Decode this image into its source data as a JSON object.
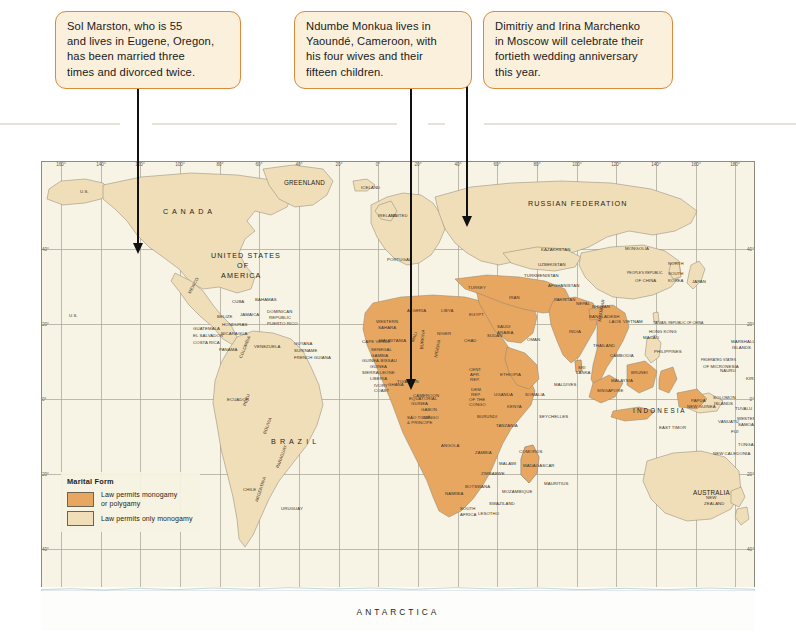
{
  "callouts": [
    {
      "id": "callout-sol-marston",
      "lines": [
        "Sol Marston, who is 55",
        "and lives in Eugene, Oregon,",
        "has been married three",
        "times and divorced twice."
      ]
    },
    {
      "id": "callout-ndumbe-monkua",
      "lines": [
        "Ndumbe Monkua lives in",
        "Yaoundé, Cameroon, with",
        "his four wives and their",
        "fifteen children."
      ]
    },
    {
      "id": "callout-marchenko",
      "lines": [
        "Dimitriy and Irina Marchenko",
        "in Moscow will celebrate their",
        "fortieth wedding anniversary",
        "this year."
      ]
    }
  ],
  "legend": {
    "title": "Marital Form",
    "items": [
      {
        "label_line1": "Law permits monogamy",
        "label_line2": "or polygamy",
        "color": "#e8a761"
      },
      {
        "label_line1": "Law permits only monogamy",
        "label_line2": "",
        "color": "#f0deb8"
      }
    ]
  },
  "map": {
    "antarctica_label": "ANTARCTICA",
    "longitudes": [
      "160°",
      "140°",
      "120°",
      "100°",
      "80°",
      "60°",
      "40°",
      "20°",
      "0°",
      "20°",
      "40°",
      "60°",
      "80°",
      "100°",
      "120°",
      "140°",
      "160°",
      "180°"
    ],
    "latitudes": [
      "40°",
      "20°",
      "0°",
      "20°",
      "40°"
    ],
    "colors": {
      "polygamy": "#e8a761",
      "monogamy": "#f0deb8",
      "ocean": "#f7f4e6",
      "border": "#8d8d7d",
      "graticule": "#a9a797"
    },
    "continent_labels": [
      {
        "text": "C A N A D A",
        "x": 122,
        "y": 46,
        "size": "mid"
      },
      {
        "text": "UNITED STATES",
        "x": 170,
        "y": 90,
        "size": "mid"
      },
      {
        "text": "OF",
        "x": 196,
        "y": 100,
        "size": "mid"
      },
      {
        "text": "AMERICA",
        "x": 180,
        "y": 110,
        "size": "mid"
      },
      {
        "text": "GREENLAND",
        "x": 243,
        "y": 18,
        "size": "norm"
      },
      {
        "text": "RUSSIAN   FEDERATION",
        "x": 487,
        "y": 38,
        "size": "mid"
      },
      {
        "text": "B R A Z I L",
        "x": 230,
        "y": 276,
        "size": "mid"
      },
      {
        "text": "A N T A R C T I C A",
        "x": 0,
        "y": 0,
        "size": "big"
      },
      {
        "text": "I N D O N E S I A",
        "x": 592,
        "y": 246,
        "size": "norm"
      },
      {
        "text": "AUSTRALIA",
        "x": 652,
        "y": 328,
        "size": "norm"
      }
    ],
    "country_labels": [
      {
        "t": "U.S.",
        "x": 39,
        "y": 28
      },
      {
        "t": "U.S.",
        "x": 28,
        "y": 152
      },
      {
        "t": "MEXICO",
        "x": 146,
        "y": 131,
        "r": -62
      },
      {
        "t": "CUBA",
        "x": 191,
        "y": 138
      },
      {
        "t": "BAHAMAS",
        "x": 214,
        "y": 136
      },
      {
        "t": "DOMINICAN",
        "x": 226,
        "y": 148
      },
      {
        "t": "REPUBLIC",
        "x": 228,
        "y": 154
      },
      {
        "t": "PUERTO RICO",
        "x": 226,
        "y": 160
      },
      {
        "t": "BELIZE",
        "x": 176,
        "y": 153
      },
      {
        "t": "JAMAICA",
        "x": 199,
        "y": 151
      },
      {
        "t": "GUATEMALA",
        "x": 152,
        "y": 165
      },
      {
        "t": "HONDURAS",
        "x": 181,
        "y": 161
      },
      {
        "t": "EL SALVADOR",
        "x": 152,
        "y": 172
      },
      {
        "t": "NICARAGUA",
        "x": 180,
        "y": 170
      },
      {
        "t": "COSTA RICA",
        "x": 152,
        "y": 179
      },
      {
        "t": "PANAMA",
        "x": 178,
        "y": 186
      },
      {
        "t": "VENEZUELA",
        "x": 213,
        "y": 183
      },
      {
        "t": "GUYANA",
        "x": 253,
        "y": 180
      },
      {
        "t": "SURINAME",
        "x": 253,
        "y": 187
      },
      {
        "t": "FRENCH GUIANA",
        "x": 253,
        "y": 194
      },
      {
        "t": "ECUADOR",
        "x": 186,
        "y": 236
      },
      {
        "t": "COLOMBIA",
        "x": 197,
        "y": 196,
        "r": -68
      },
      {
        "t": "PERU",
        "x": 201,
        "y": 244,
        "r": -72
      },
      {
        "t": "BOLIVIA",
        "x": 221,
        "y": 272,
        "r": -70
      },
      {
        "t": "CHILE",
        "x": 202,
        "y": 326
      },
      {
        "t": "ARGENTINA",
        "x": 213,
        "y": 340,
        "r": -72
      },
      {
        "t": "URUGUAY",
        "x": 240,
        "y": 345
      },
      {
        "t": "PARAGUAY",
        "x": 234,
        "y": 306,
        "r": -70
      },
      {
        "t": "PORTUGAL",
        "x": 346,
        "y": 96
      },
      {
        "t": "ICELAND",
        "x": 320,
        "y": 24
      },
      {
        "t": "IRELAND",
        "x": 337,
        "y": 52
      },
      {
        "t": "UNITED",
        "x": 350,
        "y": 52
      },
      {
        "t": "TURKEY",
        "x": 427,
        "y": 124
      },
      {
        "t": "IRAN",
        "x": 468,
        "y": 134
      },
      {
        "t": "ALGERIA",
        "x": 366,
        "y": 147
      },
      {
        "t": "LIBYA",
        "x": 400,
        "y": 147
      },
      {
        "t": "EGYPT",
        "x": 428,
        "y": 151
      },
      {
        "t": "SAUDI",
        "x": 456,
        "y": 163
      },
      {
        "t": "ARABIA",
        "x": 456,
        "y": 169
      },
      {
        "t": "OMAN",
        "x": 486,
        "y": 176
      },
      {
        "t": "WESTERN",
        "x": 335,
        "y": 158
      },
      {
        "t": "SAHARA",
        "x": 337,
        "y": 164
      },
      {
        "t": "MAURITANIA",
        "x": 338,
        "y": 177
      },
      {
        "t": "MALI",
        "x": 369,
        "y": 180,
        "r": -70
      },
      {
        "t": "NIGER",
        "x": 396,
        "y": 170
      },
      {
        "t": "CHAD",
        "x": 423,
        "y": 177
      },
      {
        "t": "SUDAN",
        "x": 446,
        "y": 172
      },
      {
        "t": "SENEGAL",
        "x": 330,
        "y": 186
      },
      {
        "t": "CAPE VERDE",
        "x": 321,
        "y": 178
      },
      {
        "t": "GAMBIA",
        "x": 330,
        "y": 192
      },
      {
        "t": "GUINEA-BISSAU",
        "x": 321,
        "y": 197
      },
      {
        "t": "GUINEA",
        "x": 329,
        "y": 203
      },
      {
        "t": "SIERRA LEONE",
        "x": 321,
        "y": 209
      },
      {
        "t": "LIBERIA",
        "x": 329,
        "y": 215
      },
      {
        "t": "BURKINA",
        "x": 378,
        "y": 188,
        "r": -85
      },
      {
        "t": "NIGERIA",
        "x": 392,
        "y": 196,
        "r": -78
      },
      {
        "t": "IVORY",
        "x": 333,
        "y": 222
      },
      {
        "t": "COAST",
        "x": 333,
        "y": 227
      },
      {
        "t": "GHANA",
        "x": 347,
        "y": 221
      },
      {
        "t": "TOGO",
        "x": 356,
        "y": 218
      },
      {
        "t": "BENIN",
        "x": 364,
        "y": 218
      },
      {
        "t": "CAMEROON",
        "x": 372,
        "y": 232
      },
      {
        "t": "CENT.",
        "x": 428,
        "y": 206
      },
      {
        "t": "AFR.",
        "x": 429,
        "y": 211
      },
      {
        "t": "REP.",
        "x": 429,
        "y": 216
      },
      {
        "t": "ETHIOPIA",
        "x": 459,
        "y": 211
      },
      {
        "t": "SOMALIA",
        "x": 484,
        "y": 231
      },
      {
        "t": "DEM.",
        "x": 430,
        "y": 226
      },
      {
        "t": "REP.",
        "x": 430,
        "y": 231
      },
      {
        "t": "OF THE",
        "x": 428,
        "y": 236
      },
      {
        "t": "CONGO",
        "x": 428,
        "y": 241
      },
      {
        "t": "UGANDA",
        "x": 453,
        "y": 231
      },
      {
        "t": "KENYA",
        "x": 466,
        "y": 243
      },
      {
        "t": "GABON",
        "x": 380,
        "y": 246
      },
      {
        "t": "CONGO",
        "x": 381,
        "y": 254
      },
      {
        "t": "EQUATORIAL",
        "x": 368,
        "y": 235
      },
      {
        "t": "GUINEA",
        "x": 370,
        "y": 240
      },
      {
        "t": "SÃO TOMÉ",
        "x": 366,
        "y": 254
      },
      {
        "t": "& PRINCIPE",
        "x": 366,
        "y": 259
      },
      {
        "t": "TANZANIA",
        "x": 455,
        "y": 262
      },
      {
        "t": "BURUNDI",
        "x": 436,
        "y": 253
      },
      {
        "t": "ANGOLA",
        "x": 400,
        "y": 282
      },
      {
        "t": "ZAMBIA",
        "x": 434,
        "y": 289
      },
      {
        "t": "ZIMBABWE",
        "x": 440,
        "y": 310
      },
      {
        "t": "BOTSWANA",
        "x": 424,
        "y": 323
      },
      {
        "t": "NAMIBIA",
        "x": 404,
        "y": 330
      },
      {
        "t": "MOZAMBIQUE",
        "x": 461,
        "y": 328
      },
      {
        "t": "MADAGASCAR",
        "x": 482,
        "y": 302
      },
      {
        "t": "MALAWI",
        "x": 458,
        "y": 300
      },
      {
        "t": "SOUTH",
        "x": 419,
        "y": 345
      },
      {
        "t": "AFRICA",
        "x": 419,
        "y": 351
      },
      {
        "t": "LESOTHO",
        "x": 437,
        "y": 350
      },
      {
        "t": "SWAZILAND",
        "x": 448,
        "y": 340
      },
      {
        "t": "SEYCHELLES",
        "x": 498,
        "y": 253
      },
      {
        "t": "MALDIVES",
        "x": 513,
        "y": 221
      },
      {
        "t": "MAURITIUS",
        "x": 503,
        "y": 320
      },
      {
        "t": "COMOROS",
        "x": 478,
        "y": 288
      },
      {
        "t": "KAZAKHSTAN",
        "x": 500,
        "y": 86
      },
      {
        "t": "UZBEKISTAN",
        "x": 497,
        "y": 101
      },
      {
        "t": "TURKMENISTAN",
        "x": 483,
        "y": 112
      },
      {
        "t": "AFGHANISTAN",
        "x": 507,
        "y": 122
      },
      {
        "t": "PAKISTAN",
        "x": 513,
        "y": 136
      },
      {
        "t": "MONGOLIA",
        "x": 584,
        "y": 85
      },
      {
        "t": "PEOPLE'S REPUBLIC",
        "x": 586,
        "y": 110
      },
      {
        "t": "OF CHINA",
        "x": 594,
        "y": 117
      },
      {
        "t": "INDIA",
        "x": 528,
        "y": 168
      },
      {
        "t": "NEPAL",
        "x": 535,
        "y": 140
      },
      {
        "t": "BHUTAN",
        "x": 551,
        "y": 143
      },
      {
        "t": "BANGLADESH",
        "x": 548,
        "y": 153
      },
      {
        "t": "SRI",
        "x": 537,
        "y": 204
      },
      {
        "t": "LANKA",
        "x": 535,
        "y": 209
      },
      {
        "t": "MYANMAR",
        "x": 556,
        "y": 160,
        "r": -80
      },
      {
        "t": "THAILAND",
        "x": 552,
        "y": 182
      },
      {
        "t": "LAOS",
        "x": 568,
        "y": 158
      },
      {
        "t": "VIETNAM",
        "x": 582,
        "y": 158
      },
      {
        "t": "CAMBODIA",
        "x": 569,
        "y": 192
      },
      {
        "t": "MALAYSIA",
        "x": 570,
        "y": 217
      },
      {
        "t": "SINGAPORE",
        "x": 556,
        "y": 227
      },
      {
        "t": "BRUNEI",
        "x": 590,
        "y": 209
      },
      {
        "t": "PHILIPPINES",
        "x": 613,
        "y": 188
      },
      {
        "t": "JAPAN",
        "x": 651,
        "y": 118
      },
      {
        "t": "SOUTH",
        "x": 627,
        "y": 110
      },
      {
        "t": "KOREA",
        "x": 627,
        "y": 117
      },
      {
        "t": "NORTH",
        "x": 627,
        "y": 100
      },
      {
        "t": "TAIWAN, REPUBLIC OF CHINA",
        "x": 612,
        "y": 160
      },
      {
        "t": "HONG KONG",
        "x": 608,
        "y": 168
      },
      {
        "t": "MACAO",
        "x": 602,
        "y": 174
      },
      {
        "t": "FEDERATED STATES",
        "x": 660,
        "y": 197
      },
      {
        "t": "OF MICRONESIA",
        "x": 662,
        "y": 203
      },
      {
        "t": "MARSHALL",
        "x": 690,
        "y": 178
      },
      {
        "t": "ISLANDS",
        "x": 691,
        "y": 184
      },
      {
        "t": "PAPUA",
        "x": 650,
        "y": 237
      },
      {
        "t": "NEW GUINEA",
        "x": 646,
        "y": 243
      },
      {
        "t": "EAST TIMOR",
        "x": 618,
        "y": 264
      },
      {
        "t": "SOLOMON",
        "x": 672,
        "y": 234
      },
      {
        "t": "ISLANDS",
        "x": 673,
        "y": 240
      },
      {
        "t": "VANUATU",
        "x": 677,
        "y": 258
      },
      {
        "t": "TUVALU",
        "x": 694,
        "y": 245
      },
      {
        "t": "WESTERN",
        "x": 696,
        "y": 255
      },
      {
        "t": "SAMOA",
        "x": 697,
        "y": 261
      },
      {
        "t": "FIJI",
        "x": 690,
        "y": 268
      },
      {
        "t": "TONGA",
        "x": 697,
        "y": 281
      },
      {
        "t": "NEW CALEDONIA",
        "x": 672,
        "y": 290
      },
      {
        "t": "NEW",
        "x": 665,
        "y": 334
      },
      {
        "t": "ZEALAND",
        "x": 663,
        "y": 340
      },
      {
        "t": "NAURU",
        "x": 679,
        "y": 207
      },
      {
        "t": "KIRIBATI",
        "x": 705,
        "y": 215
      }
    ]
  },
  "bottom_caption": ""
}
